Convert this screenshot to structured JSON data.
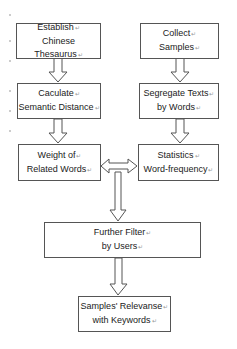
{
  "diagram": {
    "type": "flowchart",
    "nodes": [
      {
        "id": "establish",
        "lines": [
          "Establish",
          "Chinese Thesaurus"
        ]
      },
      {
        "id": "collect",
        "lines": [
          "Collect",
          "Samples"
        ]
      },
      {
        "id": "calculate",
        "lines": [
          "Caculate",
          "Semantic Distance"
        ]
      },
      {
        "id": "segregate",
        "lines": [
          "Segregate Texts",
          "by Words"
        ]
      },
      {
        "id": "weight",
        "lines": [
          "Weight of",
          "Related Words"
        ]
      },
      {
        "id": "statistics",
        "lines": [
          "Statistics",
          "Word-frequency"
        ]
      },
      {
        "id": "filter",
        "lines": [
          "Further Filter",
          "by Users"
        ]
      },
      {
        "id": "relevance",
        "lines": [
          "Samples' Relevanse",
          "with Keywords"
        ]
      }
    ],
    "edges": [
      {
        "from": "establish",
        "to": "calculate",
        "style": "hollow-arrow"
      },
      {
        "from": "collect",
        "to": "segregate",
        "style": "hollow-arrow"
      },
      {
        "from": "calculate",
        "to": "weight",
        "style": "hollow-arrow"
      },
      {
        "from": "segregate",
        "to": "statistics",
        "style": "hollow-arrow"
      },
      {
        "from": "weight",
        "to": "statistics",
        "style": "hollow-double-arrow"
      },
      {
        "from": "weight-statistics-link",
        "to": "filter",
        "style": "hollow-arrow"
      },
      {
        "from": "filter",
        "to": "relevance",
        "style": "hollow-arrow"
      }
    ],
    "paragraph_mark": "↵"
  }
}
